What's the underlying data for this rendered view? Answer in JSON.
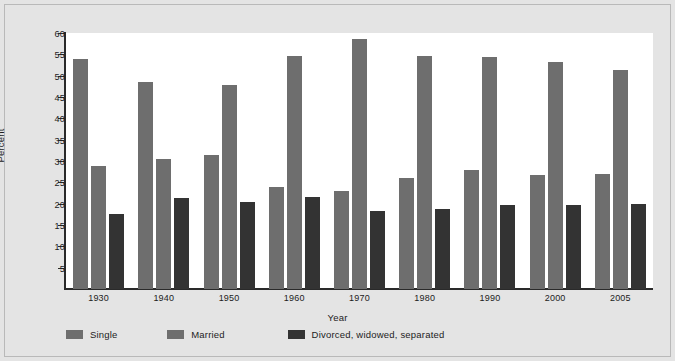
{
  "chart_data": {
    "type": "bar",
    "title": "",
    "subtitle": "",
    "xlabel": "Year",
    "ylabel": "Percent",
    "categories": [
      "1930",
      "1940",
      "1950",
      "1960",
      "1970",
      "1980",
      "1990",
      "2000",
      "2005"
    ],
    "series": [
      {
        "name": "Single",
        "color": "#6e6e6e",
        "values": [
          53.8,
          48.5,
          31.5,
          24.0,
          23.0,
          26.0,
          27.8,
          26.8,
          27.0
        ]
      },
      {
        "name": "Married",
        "color": "#6e6e6e",
        "values": [
          28.8,
          30.4,
          47.9,
          54.5,
          58.5,
          54.6,
          54.4,
          53.1,
          51.3
        ]
      },
      {
        "name": "Divorced, widowed, separated",
        "color": "#333333",
        "values": [
          17.5,
          21.3,
          20.5,
          21.5,
          18.3,
          18.8,
          19.7,
          19.8,
          20.0
        ]
      }
    ],
    "ylim": [
      0,
      60
    ],
    "yticks": [
      5,
      10,
      15,
      20,
      25,
      30,
      35,
      40,
      45,
      50,
      55,
      60
    ],
    "ytick_labels": [
      "5",
      "10",
      "15",
      "20",
      "25",
      "30",
      "35",
      "40",
      "45",
      "50",
      "55",
      "60"
    ],
    "grid": false,
    "legend_position": "bottom-left",
    "legend": [
      "Single",
      "Married",
      "Divorced, widowed, separated"
    ],
    "background_color": "#e4e4e4",
    "plot_background_color": "#ffffff",
    "axis_color": "#2a2a2a"
  }
}
